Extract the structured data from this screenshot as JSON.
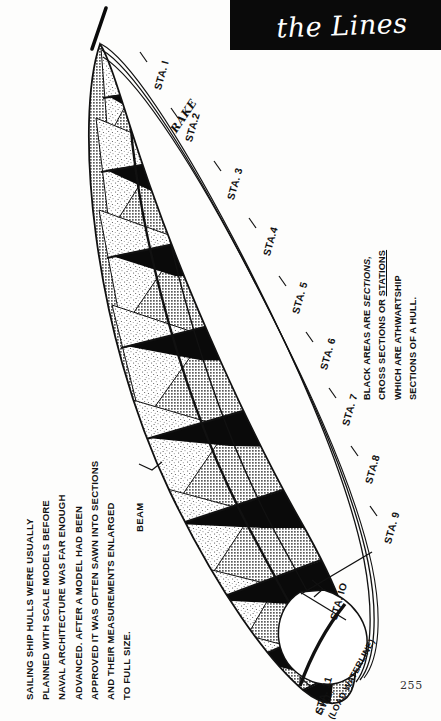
{
  "page": {
    "number": "255",
    "background_color": "#ffffff",
    "ink_color": "#111111"
  },
  "title_plate": {
    "title": "the Lines",
    "background_color": "#0a0a0a",
    "text_color": "#ffffff"
  },
  "captions": {
    "left": {
      "lines": [
        "SAILING SHIP HULLS WERE USUALLY",
        "PLANNED WITH SCALE MODELS BEFORE",
        "NAVAL ARCHITECTURE WAS FAR ENOUGH",
        "ADVANCED. AFTER A MODEL HAD BEEN",
        "APPROVED IT WAS OFTEN SAWN INTO SECTIONS",
        "AND THEIR MEASUREMENTS ENLARGED",
        "TO FULL SIZE."
      ]
    },
    "right": {
      "line1_pre": "BLACK AREAS ARE ",
      "line1_em": "SECTIONS,",
      "line2_pre": "CROSS SECTIONS OR ",
      "line2_u": "STATIONS",
      "line3": "WHICH ARE ATHWARTSHIP",
      "line4": "SECTIONS OF A HULL."
    }
  },
  "labels": {
    "rake": "RAKE",
    "beam": "BEAM",
    "lwl_line1": "L.W.L.",
    "lwl_line2": "(LOAD WATERLINE)"
  },
  "stations": [
    {
      "label": "STA. I",
      "x": 152,
      "y": 88,
      "rot": -74,
      "tick": [
        146,
        62,
        139,
        51
      ]
    },
    {
      "label": "STA.2",
      "x": 183,
      "y": 140,
      "rot": -74,
      "tick": [
        178,
        119,
        170,
        108
      ]
    },
    {
      "label": "STA. 3",
      "x": 225,
      "y": 198,
      "rot": -74,
      "tick": [
        221,
        172,
        213,
        161
      ]
    },
    {
      "label": "STA.4",
      "x": 261,
      "y": 254,
      "rot": -74,
      "tick": [
        257,
        228,
        249,
        217
      ]
    },
    {
      "label": "STA. 5",
      "x": 290,
      "y": 312,
      "rot": -74,
      "tick": [
        286,
        286,
        278,
        275
      ]
    },
    {
      "label": "STA. 6",
      "x": 318,
      "y": 368,
      "rot": -74,
      "tick": [
        314,
        342,
        306,
        331
      ]
    },
    {
      "label": "STA. 7",
      "x": 340,
      "y": 424,
      "rot": -74,
      "tick": [
        336,
        398,
        328,
        387
      ]
    },
    {
      "label": "STA.8",
      "x": 363,
      "y": 482,
      "rot": -74,
      "tick": [
        359,
        456,
        351,
        445
      ]
    },
    {
      "label": "STA. 9",
      "x": 382,
      "y": 542,
      "rot": -74,
      "tick": [
        378,
        516,
        370,
        505
      ]
    },
    {
      "label": "STA. IO",
      "x": 328,
      "y": 618,
      "rot": -74,
      "tick": [
        324,
        592,
        314,
        581
      ]
    },
    {
      "label": "STA. 11",
      "x": 313,
      "y": 712,
      "rot": -74,
      "tick": [
        309,
        686,
        300,
        676
      ]
    }
  ],
  "diagram": {
    "hull_fill": "#bdbdbd",
    "section_fill": "#0a0a0a",
    "stipple_fill": "#efefef",
    "outline_color": "#111111",
    "slab_count": 11
  }
}
